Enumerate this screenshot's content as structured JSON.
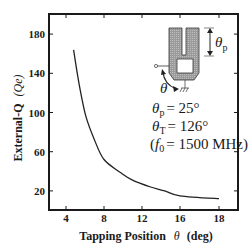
{
  "chart_data": {
    "type": "line",
    "title": "",
    "xlabel": "Tapping Position θ (deg)",
    "ylabel": "External-Q (Qe)",
    "xlim": [
      2,
      20
    ],
    "ylim": [
      0,
      200
    ],
    "x_ticks": [
      {
        "label": "4",
        "px": 66
      },
      {
        "label": "8",
        "px": 104
      },
      {
        "label": "12",
        "px": 142
      },
      {
        "label": "16",
        "px": 180
      },
      {
        "label": "18",
        "px": 219
      }
    ],
    "y_ticks": [
      {
        "label": "180",
        "value": 180
      },
      {
        "label": "140",
        "value": 140
      },
      {
        "label": "100",
        "value": 100
      },
      {
        "label": "60",
        "value": 60
      },
      {
        "label": "20",
        "value": 20
      }
    ],
    "grid": false,
    "legend": null,
    "series": [
      {
        "name": "External-Q",
        "x": [
          4.8,
          5.4,
          6.1,
          7.0,
          8.0,
          9.7,
          11.0,
          12.9,
          14.4,
          16.0,
          18.0
        ],
        "y": [
          164,
          128,
          96,
          72,
          52,
          39,
          31,
          24,
          20,
          15,
          12
        ]
      }
    ],
    "annotations": {
      "theta_p": "θp = 25°",
      "theta_t": "θT = 126°",
      "f0": "(f0 = 1500 MHz)"
    }
  },
  "labels": {
    "xlabel_main": "Tapping Position",
    "xlabel_symbol": "θ",
    "xlabel_unit": "(deg)",
    "ylabel_main": "External-Q",
    "ylabel_symbol": "(Qe)",
    "theta_p_lhs": "θ",
    "theta_p_sub": "p",
    "theta_p_rhs": "= 25°",
    "theta_t_lhs": "θ",
    "theta_t_sub": "T",
    "theta_t_rhs": "= 126°",
    "f0_open": "(",
    "f0_f": "f",
    "f0_sub": "0",
    "f0_rhs": "= 1500 MHz)",
    "inset_theta_p": "θ",
    "inset_theta_p_sub": "p",
    "inset_theta": "θ"
  }
}
